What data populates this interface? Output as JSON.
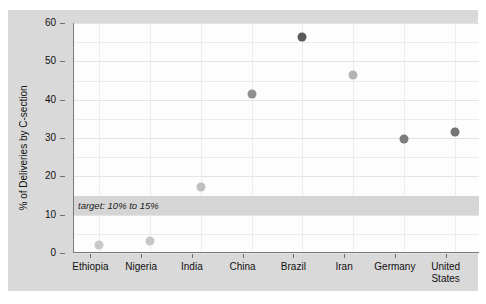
{
  "chart_data": {
    "type": "scatter",
    "title": "",
    "subtitle": "",
    "xlabel": "",
    "ylabel": "% of Deliveries by C-section",
    "categories": [
      "Ethiopia",
      "Nigeria",
      "India",
      "China",
      "Brazil",
      "Iran",
      "Germany",
      "United States"
    ],
    "values": [
      2.0,
      3.2,
      17.3,
      41.5,
      56.3,
      46.5,
      29.8,
      31.6
    ],
    "series": [
      {
        "name": "% of Deliveries by C-section",
        "values": [
          2.0,
          3.2,
          17.3,
          41.5,
          56.3,
          46.5,
          29.8,
          31.6
        ]
      }
    ],
    "ylim": [
      0,
      60
    ],
    "y_ticks": [
      0,
      10,
      20,
      30,
      40,
      50,
      60
    ],
    "y_tick_labels": [
      "0",
      "10",
      "20",
      "30",
      "40",
      "50",
      "60"
    ],
    "grid": true,
    "legend": "none",
    "marker_colors": [
      "#c9c9c9",
      "#c6c6c6",
      "#bfbfbf",
      "#8f8f8f",
      "#595959",
      "#b3b3b3",
      "#7d7d7d",
      "#757575"
    ],
    "annotations": [
      {
        "text": "target: 10% to 15%",
        "y_start": 10,
        "y_end": 15,
        "band_color": "#d5d5d5"
      }
    ]
  },
  "style": {
    "panel_background": "#d9d9d9",
    "plot_background": "#fdfdfd",
    "axis_color": "#7a7a7a",
    "grid_color": "#ececec",
    "text_color": "#111111"
  },
  "axis": {
    "y_title": "% of Deliveries by C-section"
  },
  "annotation": {
    "target_label": "target: 10% to 15%"
  },
  "x_labels": [
    "Ethiopia",
    "Nigeria",
    "India",
    "China",
    "Brazil",
    "Iran",
    "Germany",
    "United\nStates"
  ],
  "y_labels": [
    "0",
    "10",
    "20",
    "30",
    "40",
    "50",
    "60"
  ]
}
